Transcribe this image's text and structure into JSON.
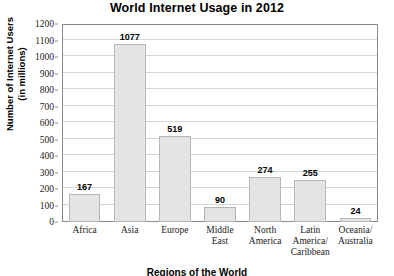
{
  "chart_data": {
    "type": "bar",
    "title": "World Internet Usage in 2012",
    "xlabel": "Regions of the World",
    "ylabel": "Number of Internet Users (in millions)",
    "ylabel_lines": [
      "Number of Internet Users",
      "(in millions)"
    ],
    "categories": [
      "Africa",
      "Asia",
      "Europe",
      "Middle East",
      "North America",
      "Latin America/Caribbean",
      "Oceania/Australia"
    ],
    "category_lines": [
      [
        "Africa"
      ],
      [
        "Asia"
      ],
      [
        "Europe"
      ],
      [
        "Middle",
        "East"
      ],
      [
        "North",
        "America"
      ],
      [
        "Latin",
        "America/",
        "Caribbean"
      ],
      [
        "Oceania/",
        "Australia"
      ]
    ],
    "values": [
      167,
      1077,
      519,
      90,
      274,
      255,
      24
    ],
    "value_labels": [
      "167",
      "1077",
      "519",
      "90",
      "274",
      "255",
      "24"
    ],
    "ylim": [
      0,
      1200
    ],
    "ytick_step": 100,
    "yticks": [
      0,
      100,
      200,
      300,
      400,
      500,
      600,
      700,
      800,
      900,
      1000,
      1100,
      1200
    ],
    "ytick_labels": [
      "0",
      "100",
      "200",
      "300",
      "400",
      "500",
      "600",
      "700",
      "800",
      "900",
      "1000",
      "1100",
      "1200"
    ],
    "grid": true,
    "legend": false,
    "colors": {
      "bar_fill": "#e4e4e4",
      "bar_border": "#b6b6b6",
      "gridline": "#d5d5d5",
      "axis": "#8a8a8a",
      "text": "#000000",
      "background": "#ffffff"
    }
  }
}
